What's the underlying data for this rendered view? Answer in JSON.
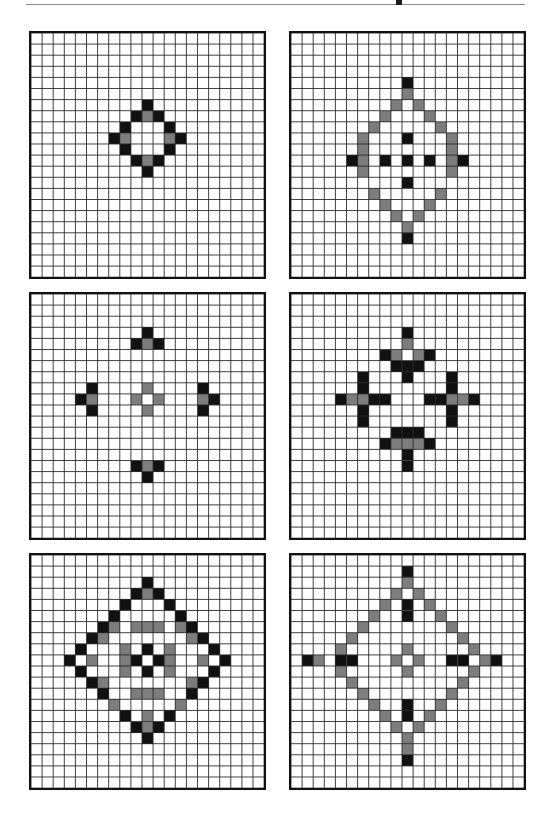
{
  "document": {
    "title": "Cellular automaton pattern plate",
    "header_rule": "horizontal-rule",
    "header_mark": "page-mark",
    "background_color": "#ffffff",
    "grid_line_color": "#2b2b2b",
    "border_color": "#111111"
  },
  "legend": {
    "black_label": "black-cell",
    "gray_label": "gray-cell",
    "white_label": "white-cell",
    "black_color": "#111111",
    "gray_color": "#7d7d7d",
    "white_color": "#ffffff"
  },
  "layout": {
    "columns": 2,
    "rows": 3,
    "panel_count": 6,
    "cell_size": 11.1,
    "panel_geometry": [
      {
        "left": 29,
        "top": 31,
        "cols": 21,
        "rows": 22
      },
      {
        "left": 289,
        "top": 31,
        "cols": 21,
        "rows": 22
      },
      {
        "left": 29,
        "top": 292,
        "cols": 21,
        "rows": 22
      },
      {
        "left": 289,
        "top": 292,
        "cols": 21,
        "rows": 22
      },
      {
        "left": 29,
        "top": 553,
        "cols": 21,
        "rows": 21
      },
      {
        "left": 289,
        "top": 553,
        "cols": 21,
        "rows": 21
      }
    ]
  },
  "panels": [
    {
      "name": "panel-1",
      "label": "Pattern 1",
      "cols": 21,
      "rows": 22,
      "black_cells": [
        [
          10,
          6
        ],
        [
          9,
          7
        ],
        [
          11,
          7
        ],
        [
          8,
          8
        ],
        [
          12,
          8
        ],
        [
          7,
          9
        ],
        [
          13,
          9
        ],
        [
          8,
          10
        ],
        [
          12,
          10
        ],
        [
          9,
          11
        ],
        [
          11,
          11
        ],
        [
          10,
          12
        ]
      ],
      "gray_cells": [
        [
          10,
          7
        ],
        [
          8,
          9
        ],
        [
          12,
          9
        ],
        [
          10,
          11
        ]
      ]
    },
    {
      "name": "panel-2",
      "label": "Pattern 2",
      "cols": 21,
      "rows": 22,
      "black_cells": [
        [
          10,
          4
        ],
        [
          10,
          9
        ],
        [
          5,
          11
        ],
        [
          8,
          11
        ],
        [
          10,
          11
        ],
        [
          12,
          11
        ],
        [
          15,
          11
        ],
        [
          10,
          13
        ],
        [
          10,
          18
        ]
      ],
      "gray_cells": [
        [
          10,
          5
        ],
        [
          9,
          6
        ],
        [
          11,
          6
        ],
        [
          8,
          7
        ],
        [
          12,
          7
        ],
        [
          7,
          8
        ],
        [
          13,
          8
        ],
        [
          6,
          10
        ],
        [
          14,
          10
        ],
        [
          6,
          9
        ],
        [
          14,
          9
        ],
        [
          6,
          11
        ],
        [
          14,
          11
        ],
        [
          6,
          12
        ],
        [
          14,
          12
        ],
        [
          7,
          14
        ],
        [
          13,
          14
        ],
        [
          8,
          15
        ],
        [
          12,
          15
        ],
        [
          9,
          16
        ],
        [
          11,
          16
        ],
        [
          10,
          17
        ]
      ]
    },
    {
      "name": "panel-3",
      "label": "Pattern 3",
      "cols": 21,
      "rows": 22,
      "black_cells": [
        [
          10,
          3
        ],
        [
          9,
          4
        ],
        [
          11,
          4
        ],
        [
          5,
          8
        ],
        [
          15,
          8
        ],
        [
          4,
          9
        ],
        [
          16,
          9
        ],
        [
          5,
          10
        ],
        [
          15,
          10
        ],
        [
          9,
          15
        ],
        [
          11,
          15
        ],
        [
          10,
          16
        ]
      ],
      "gray_cells": [
        [
          10,
          4
        ],
        [
          5,
          9
        ],
        [
          15,
          9
        ],
        [
          10,
          8
        ],
        [
          9,
          9
        ],
        [
          11,
          9
        ],
        [
          10,
          10
        ],
        [
          10,
          15
        ]
      ]
    },
    {
      "name": "panel-4",
      "label": "Pattern 4",
      "cols": 21,
      "rows": 22,
      "black_cells": [
        [
          10,
          3
        ],
        [
          8,
          5
        ],
        [
          12,
          5
        ],
        [
          9,
          6
        ],
        [
          10,
          6
        ],
        [
          11,
          6
        ],
        [
          6,
          7
        ],
        [
          14,
          7
        ],
        [
          10,
          7
        ],
        [
          7,
          9
        ],
        [
          8,
          9
        ],
        [
          13,
          9
        ],
        [
          12,
          9
        ],
        [
          4,
          9
        ],
        [
          16,
          9
        ],
        [
          6,
          8
        ],
        [
          14,
          8
        ],
        [
          6,
          10
        ],
        [
          14,
          10
        ],
        [
          6,
          11
        ],
        [
          14,
          11
        ],
        [
          9,
          12
        ],
        [
          10,
          12
        ],
        [
          11,
          12
        ],
        [
          8,
          13
        ],
        [
          12,
          13
        ],
        [
          10,
          14
        ],
        [
          10,
          15
        ]
      ],
      "gray_cells": [
        [
          10,
          4
        ],
        [
          9,
          5
        ],
        [
          11,
          5
        ],
        [
          6,
          9
        ],
        [
          14,
          9
        ],
        [
          5,
          9
        ],
        [
          15,
          9
        ],
        [
          9,
          13
        ],
        [
          11,
          13
        ],
        [
          10,
          13
        ]
      ]
    },
    {
      "name": "panel-5",
      "label": "Pattern 5",
      "cols": 21,
      "rows": 21,
      "black_cells": [
        [
          10,
          2
        ],
        [
          9,
          3
        ],
        [
          11,
          3
        ],
        [
          8,
          4
        ],
        [
          12,
          4
        ],
        [
          7,
          5
        ],
        [
          13,
          5
        ],
        [
          6,
          6
        ],
        [
          14,
          6
        ],
        [
          5,
          7
        ],
        [
          15,
          7
        ],
        [
          4,
          8
        ],
        [
          16,
          8
        ],
        [
          3,
          9
        ],
        [
          17,
          9
        ],
        [
          4,
          10
        ],
        [
          16,
          10
        ],
        [
          5,
          11
        ],
        [
          15,
          11
        ],
        [
          6,
          12
        ],
        [
          14,
          12
        ],
        [
          7,
          13
        ],
        [
          13,
          13
        ],
        [
          8,
          14
        ],
        [
          12,
          14
        ],
        [
          9,
          15
        ],
        [
          11,
          15
        ],
        [
          10,
          16
        ],
        [
          10,
          8
        ],
        [
          9,
          9
        ],
        [
          11,
          9
        ],
        [
          10,
          10
        ]
      ],
      "gray_cells": [
        [
          10,
          3
        ],
        [
          7,
          6
        ],
        [
          13,
          6
        ],
        [
          6,
          7
        ],
        [
          14,
          7
        ],
        [
          9,
          6
        ],
        [
          10,
          6
        ],
        [
          11,
          6
        ],
        [
          8,
          8
        ],
        [
          12,
          8
        ],
        [
          5,
          9
        ],
        [
          15,
          9
        ],
        [
          8,
          9
        ],
        [
          12,
          9
        ],
        [
          8,
          10
        ],
        [
          12,
          10
        ],
        [
          6,
          11
        ],
        [
          14,
          11
        ],
        [
          9,
          12
        ],
        [
          10,
          12
        ],
        [
          11,
          12
        ],
        [
          7,
          13
        ],
        [
          13,
          13
        ],
        [
          10,
          14
        ],
        [
          10,
          15
        ]
      ]
    },
    {
      "name": "panel-6",
      "label": "Pattern 6",
      "cols": 21,
      "rows": 21,
      "black_cells": [
        [
          10,
          1
        ],
        [
          10,
          4
        ],
        [
          10,
          5
        ],
        [
          1,
          9
        ],
        [
          4,
          9
        ],
        [
          5,
          9
        ],
        [
          14,
          9
        ],
        [
          15,
          9
        ],
        [
          18,
          9
        ],
        [
          10,
          13
        ],
        [
          10,
          14
        ],
        [
          10,
          18
        ]
      ],
      "gray_cells": [
        [
          10,
          2
        ],
        [
          9,
          3
        ],
        [
          11,
          3
        ],
        [
          8,
          4
        ],
        [
          12,
          4
        ],
        [
          7,
          5
        ],
        [
          13,
          5
        ],
        [
          6,
          6
        ],
        [
          14,
          6
        ],
        [
          5,
          7
        ],
        [
          15,
          7
        ],
        [
          4,
          8
        ],
        [
          16,
          8
        ],
        [
          10,
          8
        ],
        [
          2,
          9
        ],
        [
          9,
          9
        ],
        [
          11,
          9
        ],
        [
          17,
          9
        ],
        [
          4,
          10
        ],
        [
          16,
          10
        ],
        [
          10,
          10
        ],
        [
          5,
          11
        ],
        [
          15,
          11
        ],
        [
          6,
          12
        ],
        [
          14,
          12
        ],
        [
          7,
          13
        ],
        [
          13,
          13
        ],
        [
          8,
          14
        ],
        [
          12,
          14
        ],
        [
          9,
          15
        ],
        [
          11,
          15
        ],
        [
          10,
          16
        ],
        [
          10,
          17
        ]
      ]
    }
  ]
}
